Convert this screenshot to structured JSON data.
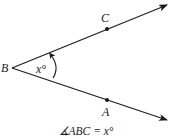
{
  "diagram": {
    "type": "angle",
    "vertex": {
      "label": "B"
    },
    "points": [
      {
        "label": "C",
        "ray": "upper"
      },
      {
        "label": "A",
        "ray": "lower"
      }
    ],
    "angle_label": "x°",
    "caption": "∡ABC = x°",
    "colors": {
      "line": "#1a1a1a",
      "background": "#ffffff"
    }
  }
}
